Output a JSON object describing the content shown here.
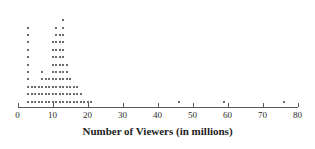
{
  "chart_data": {
    "type": "scatter",
    "plot_style": "dotplot",
    "title": "",
    "xlabel": "Number of Viewers (in millions)",
    "ylabel": "",
    "xlim": [
      0,
      80
    ],
    "ylim": [
      0,
      14
    ],
    "grid": false,
    "legend": null,
    "xticks": [
      0,
      10,
      20,
      30,
      40,
      50,
      60,
      70,
      80
    ],
    "xtick_labels": [
      "0",
      "10",
      "20",
      "30",
      "40",
      "50",
      "60",
      "70",
      "80"
    ],
    "dot_unit": "each dot = 1 observation",
    "stack_direction": "up",
    "stacks": [
      {
        "x": 3,
        "count": 11
      },
      {
        "x": 4,
        "count": 3
      },
      {
        "x": 5,
        "count": 3
      },
      {
        "x": 6,
        "count": 3
      },
      {
        "x": 7,
        "count": 5
      },
      {
        "x": 8,
        "count": 4
      },
      {
        "x": 9,
        "count": 4
      },
      {
        "x": 10,
        "count": 9
      },
      {
        "x": 11,
        "count": 11
      },
      {
        "x": 12,
        "count": 10
      },
      {
        "x": 13,
        "count": 12
      },
      {
        "x": 14,
        "count": 6
      },
      {
        "x": 15,
        "count": 4
      },
      {
        "x": 16,
        "count": 3
      },
      {
        "x": 17,
        "count": 3
      },
      {
        "x": 18,
        "count": 2
      },
      {
        "x": 19,
        "count": 1
      },
      {
        "x": 20,
        "count": 1
      },
      {
        "x": 21,
        "count": 1
      },
      {
        "x": 46,
        "count": 1
      },
      {
        "x": 59,
        "count": 1
      },
      {
        "x": 76,
        "count": 1
      }
    ],
    "values": [
      3,
      3,
      3,
      3,
      3,
      3,
      3,
      3,
      3,
      3,
      3,
      4,
      4,
      4,
      5,
      5,
      5,
      6,
      6,
      6,
      7,
      7,
      7,
      7,
      7,
      8,
      8,
      8,
      8,
      9,
      9,
      9,
      9,
      10,
      10,
      10,
      10,
      10,
      10,
      10,
      10,
      10,
      11,
      11,
      11,
      11,
      11,
      11,
      11,
      11,
      11,
      11,
      11,
      12,
      12,
      12,
      12,
      12,
      12,
      12,
      12,
      12,
      12,
      13,
      13,
      13,
      13,
      13,
      13,
      13,
      13,
      13,
      13,
      13,
      13,
      14,
      14,
      14,
      14,
      14,
      14,
      15,
      15,
      15,
      15,
      16,
      16,
      16,
      17,
      17,
      17,
      18,
      18,
      19,
      20,
      21,
      46,
      59,
      76
    ],
    "colors": {
      "dot": "#3b3b3b",
      "axis": "#5a5a5a",
      "text": "#1e1e1e",
      "background": "#ffffff"
    }
  },
  "axis": {
    "title": "Number of Viewers (in millions)"
  }
}
